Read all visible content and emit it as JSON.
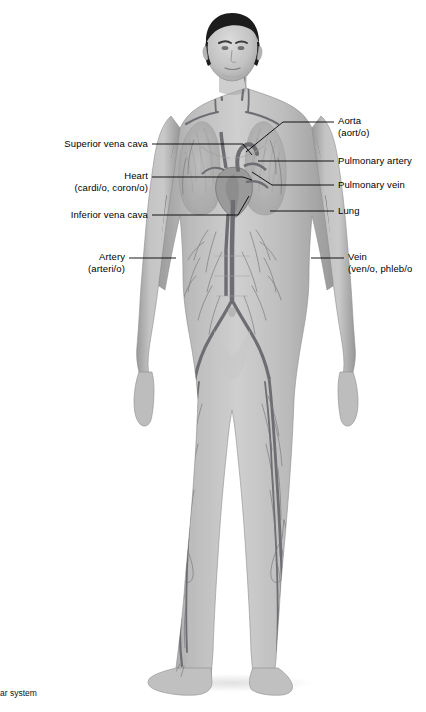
{
  "figure": {
    "title_caption": "ar system",
    "background_color": "#ffffff",
    "body_fill": "#b4b4b4",
    "vessel_color": "#6e6e73",
    "hair_color": "#1a1a1a",
    "leader_color": "#000000"
  },
  "labels_left": [
    {
      "name": "superior-vena-cava",
      "line1": "Superior vena cava",
      "line2": "",
      "text_right_x": 148,
      "text_y": 140,
      "leader": "M152,144 L243,144 L252,155"
    },
    {
      "name": "heart",
      "line1": "Heart",
      "line2": "(cardi/o, coron/o)",
      "text_right_x": 148,
      "text_y": 172,
      "leader": "M152,177 L243,177 L252,180"
    },
    {
      "name": "inferior-vena-cava",
      "line1": "Inferior vena cava",
      "line2": "",
      "text_right_x": 148,
      "text_y": 211,
      "leader": "M152,215 L238,215 L249,196"
    },
    {
      "name": "artery",
      "line1": "Artery",
      "line2": "(arteri/o)",
      "text_right_x": 125,
      "text_y": 253,
      "leader": "M129,258 L176,258"
    }
  ],
  "labels_right": [
    {
      "name": "aorta",
      "line1": "Aorta",
      "line2": "(aort/o)",
      "text_left_x": 338,
      "text_y": 117,
      "leader": "M334,122 L283,122 L246,152"
    },
    {
      "name": "pulmonary-artery",
      "line1": "Pulmonary artery",
      "line2": "",
      "text_left_x": 338,
      "text_y": 157,
      "leader": "M334,161 L258,161"
    },
    {
      "name": "pulmonary-vein",
      "line1": "Pulmonary vein",
      "line2": "",
      "text_left_x": 338,
      "text_y": 181,
      "leader": "M334,185 L272,185 L252,172"
    },
    {
      "name": "lung",
      "line1": "Lung",
      "line2": "",
      "text_left_x": 338,
      "text_y": 207,
      "leader": "M334,211 L270,211"
    },
    {
      "name": "vein",
      "line1": "Vein",
      "line2": "(ven/o, phleb/o",
      "text_left_x": 348,
      "text_y": 253,
      "leader": "M344,258 L311,258"
    }
  ]
}
